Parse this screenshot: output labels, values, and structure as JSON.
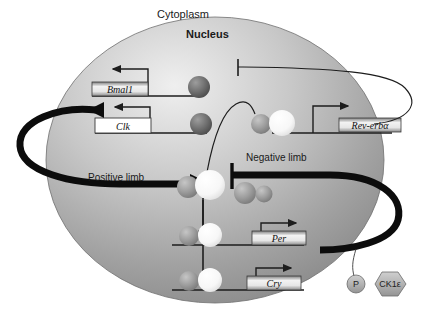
{
  "figure": {
    "title_regions": {
      "cytoplasm": "Cytoplasm",
      "nucleus": "Nucleus"
    },
    "limbs": {
      "positive": "Positive limb",
      "negative": "Negative limb"
    },
    "genes": [
      {
        "id": "bmal1",
        "label": "Bmal1",
        "box_style": "gradient"
      },
      {
        "id": "clk",
        "label": "Clk",
        "box_style": "white"
      },
      {
        "id": "reverb",
        "label": "Rev-erbα",
        "box_style": "gradient"
      },
      {
        "id": "per",
        "label": "Per",
        "box_style": "gradient"
      },
      {
        "id": "cry",
        "label": "Cry",
        "box_style": "gradient"
      }
    ],
    "kinase": {
      "phosphate_label": "P",
      "enzyme_label": "CK1ε"
    },
    "colors": {
      "background": "#ffffff",
      "nucleus_light": "#e8e8e8",
      "nucleus_dark": "#8d8d8d",
      "outline": "#2b2b2b",
      "thick_arrow": "#0c0c0c",
      "sphere_dark": "#6d6d6d",
      "sphere_mid": "#9a9a9a",
      "sphere_white": "#fbfbfb"
    }
  }
}
